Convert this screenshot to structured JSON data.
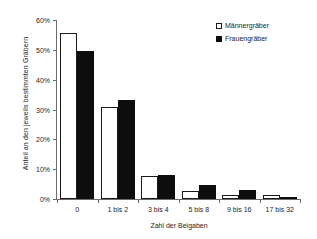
{
  "chart_data": {
    "type": "bar",
    "title": "",
    "xlabel": "Zahl der Beigaben",
    "ylabel": "Anteil an den jeweils bestimmten Gräbern",
    "categories": [
      "0",
      "1 bis 2",
      "3 bis 4",
      "5 bis 8",
      "9 bis 16",
      "17 bis 32"
    ],
    "series": [
      {
        "name": "Männergräber",
        "color": "#ffffff",
        "values": [
          55.5,
          30.8,
          7.8,
          2.8,
          1.3,
          1.4
        ]
      },
      {
        "name": "Frauengräber",
        "color": "#0d0d0d",
        "values": [
          49.5,
          33.3,
          8.2,
          4.7,
          3.0,
          0.5
        ]
      }
    ],
    "ylim": [
      0,
      60
    ],
    "yticks": [
      0,
      10,
      20,
      30,
      40,
      50,
      60
    ],
    "ytick_labels": [
      "0%",
      "10%",
      "20%",
      "30%",
      "40%",
      "50%",
      "60%"
    ],
    "grid": false,
    "legend_position": "top-right"
  },
  "axes": {
    "y_title": "Anteil an den jeweils bestimmten Gräbern",
    "x_title": "Zahl der Beigaben"
  },
  "legend": {
    "items": [
      {
        "label": "Männergräber"
      },
      {
        "label": "Frauengräber"
      }
    ]
  },
  "colors": {
    "axis": "#6d6d6d",
    "text": "#1c1c1c",
    "bar_men": "#ffffff",
    "bar_women": "#0d0d0d",
    "background": "#ffffff"
  }
}
